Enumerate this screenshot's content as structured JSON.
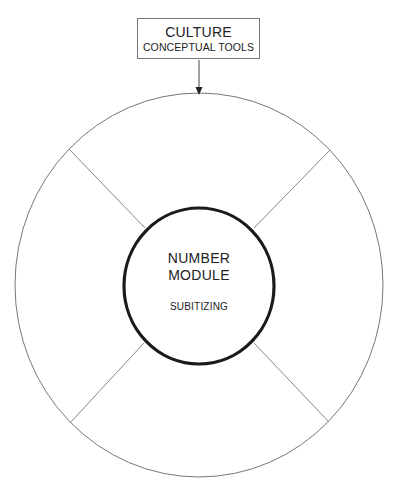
{
  "top_box": {
    "title": "CULTURE",
    "subtitle": "CONCEPTUAL TOOLS"
  },
  "center": {
    "title_line1": "NUMBER",
    "title_line2": "MODULE",
    "subtitle": "SUBITIZING"
  },
  "diagram": {
    "outer_circle": {
      "cx": 199,
      "cy": 285,
      "rx": 184,
      "ry": 192,
      "stroke": "#777777"
    },
    "inner_circle": {
      "cx": 199,
      "cy": 286,
      "rx": 75,
      "ry": 78,
      "stroke": "#1a1a1a"
    },
    "arrow": {
      "from": [
        199,
        60
      ],
      "to": [
        199,
        94
      ],
      "color": "#444444"
    },
    "spokes": [
      {
        "name": "upper-left",
        "from": [
          69,
          149
        ],
        "to": [
          145,
          228
        ]
      },
      {
        "name": "upper-right",
        "from": [
          330,
          150
        ],
        "to": [
          254,
          228
        ]
      },
      {
        "name": "lower-left",
        "from": [
          70,
          423
        ],
        "to": [
          144,
          343
        ]
      },
      {
        "name": "lower-right",
        "from": [
          328,
          421
        ],
        "to": [
          254,
          343
        ]
      }
    ]
  }
}
